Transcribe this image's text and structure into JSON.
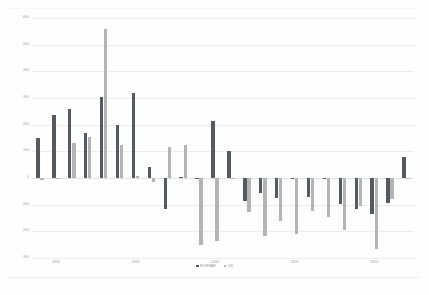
{
  "chart_data": {
    "type": "bar",
    "title": "",
    "subtitle": "",
    "xlabel": "",
    "ylabel": "",
    "ylim": [
      -300,
      600
    ],
    "grid": true,
    "legend_position": "bottom",
    "ytick_labels": [
      "600",
      "500",
      "400",
      "300",
      "200",
      "100",
      "0",
      "-100",
      "-200",
      "-300"
    ],
    "ytick_values": [
      600,
      500,
      400,
      300,
      200,
      100,
      0,
      -100,
      -200,
      -300
    ],
    "xtick_labels": [
      "1990",
      "1995",
      "2000",
      "2005",
      "2010"
    ],
    "xtick_values": [
      1990,
      1995,
      2000,
      2005,
      2010
    ],
    "categories": [
      "1989",
      "1990",
      "1991",
      "1992",
      "1993",
      "1994",
      "1995",
      "1996",
      "1997",
      "1998",
      "1999",
      "2000",
      "2001",
      "2002",
      "2003",
      "2004",
      "2005",
      "2006",
      "2007",
      "2008",
      "2009",
      "2010",
      "2011",
      "2012"
    ],
    "series": [
      {
        "name": "NORWAY",
        "color": "#555a60",
        "values": [
          150,
          237,
          260,
          168,
          305,
          200,
          320,
          40,
          -118,
          5,
          -1,
          215,
          100,
          -88,
          -58,
          -75,
          -4,
          -70,
          -3,
          -98,
          -115,
          -135,
          -92,
          78
        ]
      },
      {
        "name": "US",
        "color": "#b4b4b4",
        "values": [
          -8,
          0,
          130,
          155,
          560,
          122,
          6,
          -15,
          118,
          125,
          -250,
          -238,
          -2,
          -128,
          -218,
          -160,
          -210,
          -122,
          -145,
          -195,
          -105,
          -265,
          -78,
          -5
        ]
      }
    ]
  },
  "legend": {
    "entries": [
      {
        "label": "NORWAY",
        "color": "#555a60"
      },
      {
        "label": "US",
        "color": "#b4b4b4"
      }
    ]
  }
}
